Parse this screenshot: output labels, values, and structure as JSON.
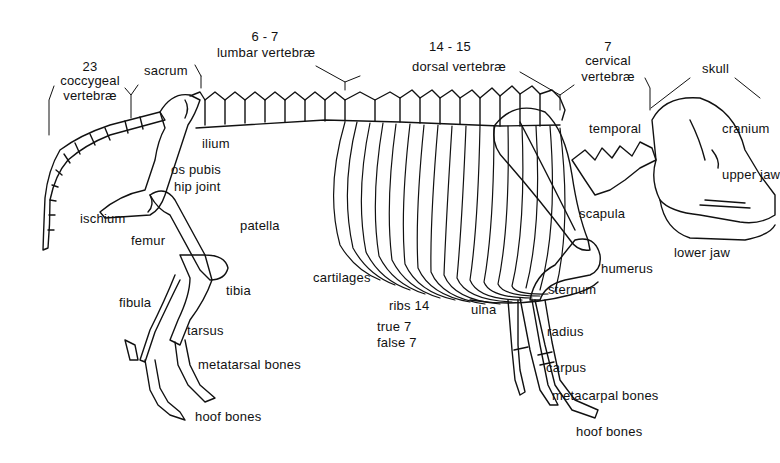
{
  "figure": {
    "labels": {
      "coccygeal_count": "23",
      "coccygeal_1": "coccygeal",
      "coccygeal_2": "vertebræ",
      "sacrum": "sacrum",
      "lumbar_count": "6 - 7",
      "lumbar": "lumbar vertebræ",
      "dorsal_count": "14 - 15",
      "dorsal": "dorsal vertebræ",
      "cervical_count": "7",
      "cervical_1": "cervical",
      "cervical_2": "vertebræ",
      "skull": "skull",
      "temporal": "temporal",
      "cranium": "cranium",
      "upper_jaw": "upper jaw",
      "lower_jaw": "lower jaw",
      "scapula": "scapula",
      "humerus": "humerus",
      "sternum": "sternum",
      "ulna": "ulna",
      "radius": "radius",
      "carpus": "carpus",
      "metacarpal": "metacarpal bones",
      "fore_hoof": "hoof bones",
      "ilium": "ilium",
      "os_pubis": "os pubis",
      "hip_joint": "hip joint",
      "ischium": "ischium",
      "femur": "femur",
      "patella": "patella",
      "tibia": "tibia",
      "fibula": "fibula",
      "tarsus": "tarsus",
      "metatarsal": "metatarsal bones",
      "hind_hoof": "hoof bones",
      "cartilages": "cartilages",
      "ribs": "ribs 14",
      "ribs_true": "true 7",
      "ribs_false": "false 7"
    }
  }
}
